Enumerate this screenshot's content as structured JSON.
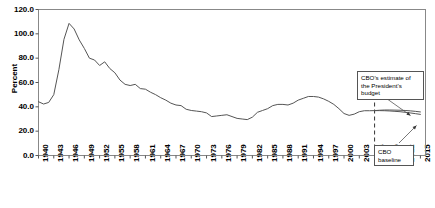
{
  "chart_data": {
    "type": "line",
    "title": "",
    "subtitle": "",
    "xlabel": "",
    "ylabel": "Percent",
    "xlim": [
      1940,
      2016
    ],
    "ylim": [
      0.0,
      120.0
    ],
    "grid": false,
    "legend": "none",
    "yticks": [
      "0.0",
      "20.0",
      "40.0",
      "60.0",
      "80.0",
      "100.0",
      "120.0"
    ],
    "ytick_values": [
      0.0,
      20.0,
      40.0,
      60.0,
      80.0,
      100.0,
      120.0
    ],
    "xticks": [
      "1940",
      "1943",
      "1946",
      "1949",
      "1952",
      "1955",
      "1958",
      "1961",
      "1964",
      "1967",
      "1970",
      "1973",
      "1976",
      "1979",
      "1982",
      "1985",
      "1988",
      "1991",
      "1994",
      "1997",
      "2000",
      "2003",
      "2006",
      "2009",
      "2012",
      "2015"
    ],
    "xtick_values": [
      1940,
      1943,
      1946,
      1949,
      1952,
      1955,
      1958,
      1961,
      1964,
      1967,
      1970,
      1973,
      1976,
      1979,
      1982,
      1985,
      1988,
      1991,
      1994,
      1997,
      2000,
      2003,
      2006,
      2009,
      2012,
      2015
    ],
    "annotations": [
      {
        "name": "cbo-president-budget",
        "text": "CBO's estimate of the President's budget",
        "lines": [
          "CBO's estimate of",
          "the President's",
          "budget"
        ]
      },
      {
        "name": "cbo-baseline",
        "text": "CBO baseline",
        "lines": [
          "CBO",
          "baseline"
        ]
      }
    ],
    "projection_divider_year": 2006,
    "series": [
      {
        "name": "Debt held by the public (historical)",
        "x": [
          1940,
          1941,
          1942,
          1943,
          1944,
          1945,
          1946,
          1947,
          1948,
          1949,
          1950,
          1951,
          1952,
          1953,
          1954,
          1955,
          1956,
          1957,
          1958,
          1959,
          1960,
          1961,
          1962,
          1963,
          1964,
          1965,
          1966,
          1967,
          1968,
          1969,
          1970,
          1971,
          1972,
          1973,
          1974,
          1975,
          1976,
          1977,
          1978,
          1979,
          1980,
          1981,
          1982,
          1983,
          1984,
          1985,
          1986,
          1987,
          1988,
          1989,
          1990,
          1991,
          1992,
          1993,
          1994,
          1995,
          1996,
          1997,
          1998,
          1999,
          2000,
          2001,
          2002,
          2003,
          2004,
          2005,
          2006
        ],
        "values": [
          44.2,
          42.3,
          43.6,
          50.0,
          70.5,
          95.5,
          108.6,
          104.0,
          95.0,
          88.0,
          80.0,
          78.5,
          74.0,
          77.0,
          71.5,
          68.0,
          62.0,
          58.5,
          57.5,
          58.5,
          55.0,
          54.5,
          52.0,
          50.0,
          47.5,
          45.5,
          43.0,
          41.5,
          41.0,
          38.0,
          37.0,
          36.5,
          36.0,
          35.0,
          32.0,
          32.5,
          33.0,
          33.5,
          32.0,
          30.5,
          30.0,
          29.5,
          31.5,
          35.5,
          37.0,
          38.5,
          41.0,
          42.0,
          42.0,
          41.5,
          43.0,
          45.5,
          47.0,
          48.5,
          48.5,
          48.0,
          46.5,
          44.5,
          42.0,
          38.5,
          34.5,
          33.0,
          34.0,
          36.0,
          36.8,
          36.8,
          36.9
        ],
        "style": "solid",
        "color": "#555555"
      },
      {
        "name": "CBO's estimate of the President's budget",
        "x": [
          2006,
          2007,
          2008,
          2009,
          2010,
          2011,
          2012,
          2013,
          2014,
          2015
        ],
        "values": [
          36.9,
          37.2,
          37.4,
          37.4,
          37.3,
          37.2,
          37.0,
          36.7,
          36.3,
          35.8
        ],
        "style": "solid",
        "color": "#555555"
      },
      {
        "name": "CBO baseline",
        "x": [
          2006,
          2007,
          2008,
          2009,
          2010,
          2011,
          2012,
          2013,
          2014,
          2015
        ],
        "values": [
          36.9,
          36.9,
          36.8,
          36.6,
          36.3,
          36.0,
          35.5,
          35.0,
          34.4,
          33.8
        ],
        "style": "solid",
        "color": "#555555"
      }
    ]
  }
}
